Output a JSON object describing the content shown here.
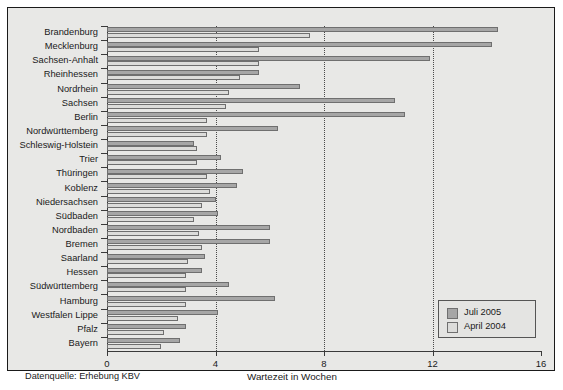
{
  "chart_data": {
    "type": "bar",
    "orientation": "horizontal",
    "title": "",
    "subtitle": "",
    "xlabel": "Wartezeit in Wochen",
    "ylabel": "",
    "xlim": [
      0,
      16
    ],
    "xticks": [
      0,
      4,
      8,
      12,
      16
    ],
    "xticklabels": [
      "0",
      "4",
      "8",
      "12",
      "16"
    ],
    "grid": "vertical dotted gridlines at 4, 8, 12",
    "legend_position": "lower right (inside axes)",
    "source_note": "Datenquelle: Erhebung  KBV",
    "categories": [
      "Brandenburg",
      "Mecklenburg",
      "Sachsen-Anhalt",
      "Rheinhessen",
      "Nordrhein",
      "Sachsen",
      "Berlin",
      "Nordwürttemberg",
      "Schleswig-Holstein",
      "Trier",
      "Thüringen",
      "Koblenz",
      "Niedersachsen",
      "Südbaden",
      "Nordbaden",
      "Bremen",
      "Saarland",
      "Hessen",
      "Südwürttemberg",
      "Hamburg",
      "Westfalen Lippe",
      "Pfalz",
      "Bayern"
    ],
    "series": [
      {
        "name": "Juli 2005",
        "color": "#a6a6a6",
        "values": [
          14.4,
          14.2,
          11.9,
          5.6,
          7.1,
          10.6,
          11.0,
          6.3,
          3.2,
          4.2,
          5.0,
          4.8,
          4.0,
          4.1,
          6.0,
          6.0,
          3.6,
          3.5,
          4.5,
          6.2,
          4.1,
          2.9,
          2.7
        ]
      },
      {
        "name": "April 2004",
        "color": "#dcdcda",
        "values": [
          7.5,
          5.6,
          5.6,
          4.9,
          4.5,
          4.4,
          3.7,
          3.7,
          3.3,
          3.3,
          3.7,
          3.8,
          3.5,
          3.2,
          3.4,
          3.5,
          3.0,
          2.9,
          2.9,
          2.9,
          2.6,
          2.1,
          2.0
        ]
      }
    ]
  },
  "legend": {
    "entries": [
      {
        "label": "Juli 2005",
        "color": "#a6a6a6"
      },
      {
        "label": "April 2004",
        "color": "#dcdcda"
      }
    ]
  },
  "axis": {
    "x_title": "Wartezeit in Wochen"
  },
  "footer": {
    "source": "Datenquelle: Erhebung  KBV"
  },
  "colors": {
    "panel_background": "#e8e8e6",
    "frame": "#1a1a1a",
    "bar_juli": "#a6a6a6",
    "bar_april": "#dcdcda",
    "bar_edge": "#6f6f6f",
    "grid": "#4a4a4a",
    "text": "#1a1a1a"
  }
}
